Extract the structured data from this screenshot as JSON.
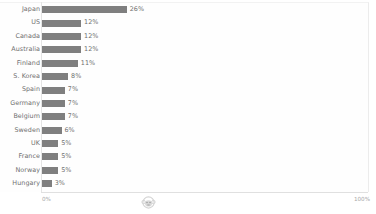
{
  "chart_data": {
    "type": "bar",
    "orientation": "horizontal",
    "title": "",
    "subtitle": "",
    "xlabel": "",
    "ylabel": "",
    "xlim": [
      0,
      100
    ],
    "grid": false,
    "legend": false,
    "value_suffix": "%",
    "categories": [
      "Japan",
      "US",
      "Canada",
      "Australia",
      "Finland",
      "S. Korea",
      "Spain",
      "Germany",
      "Belgium",
      "Sweden",
      "UK",
      "France",
      "Norway",
      "Hungary"
    ],
    "values": [
      26,
      12,
      12,
      12,
      11,
      8,
      7,
      7,
      7,
      6,
      5,
      5,
      5,
      3
    ],
    "value_labels": [
      "26%",
      "12%",
      "12%",
      "12%",
      "11%",
      "8%",
      "7%",
      "7%",
      "7%",
      "6%",
      "5%",
      "5%",
      "5%",
      "3%"
    ],
    "bar_color": "#7f7f7f",
    "axis_color": "#e0e0e0",
    "text_color": "#6f6f6f",
    "ticks": [
      {
        "label": "0%",
        "value": 0
      },
      {
        "label": "100%",
        "value": 100
      }
    ]
  },
  "watermark": {
    "icon": "monkey-face-logo-icon"
  }
}
